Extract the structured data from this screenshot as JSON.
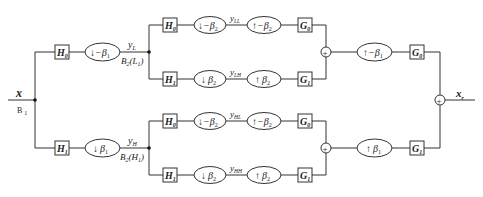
{
  "diagram": {
    "type": "two-level filter bank block diagram",
    "input": {
      "label": "x",
      "sublabel": "B",
      "sublabel_sub": "1"
    },
    "output": {
      "label": "x",
      "label_sub": "r"
    },
    "level1": {
      "low": {
        "analysis_filter": {
          "name": "H",
          "sub": "0"
        },
        "downsampler": {
          "arrow": "↓",
          "factor": "−β",
          "factor_sub": "1"
        },
        "signal": {
          "name": "y",
          "sub": "L"
        },
        "space": {
          "name": "B",
          "sub": "2",
          "arg": "L",
          "arg_sub": "1"
        }
      },
      "high": {
        "analysis_filter": {
          "name": "H",
          "sub": "1"
        },
        "downsampler": {
          "arrow": "↓",
          "factor": "β",
          "factor_sub": "1"
        },
        "signal": {
          "name": "y",
          "sub": "H"
        },
        "space": {
          "name": "B",
          "sub": "2",
          "arg": "H",
          "arg_sub": "1"
        }
      }
    },
    "level2": [
      {
        "h": {
          "name": "H",
          "sub": "0"
        },
        "down": {
          "arrow": "↓",
          "factor": "−β",
          "factor_sub": "2"
        },
        "signal": {
          "name": "y",
          "sub": "LL"
        },
        "up": {
          "arrow": "↑",
          "factor": "−β",
          "factor_sub": "2"
        },
        "g": {
          "name": "G",
          "sub": "0"
        }
      },
      {
        "h": {
          "name": "H",
          "sub": "1"
        },
        "down": {
          "arrow": "↓",
          "factor": "β",
          "factor_sub": "2"
        },
        "signal": {
          "name": "y",
          "sub": "LH"
        },
        "up": {
          "arrow": "↑",
          "factor": "β",
          "factor_sub": "2"
        },
        "g": {
          "name": "G",
          "sub": "1"
        }
      },
      {
        "h": {
          "name": "H",
          "sub": "0"
        },
        "down": {
          "arrow": "↓",
          "factor": "−β",
          "factor_sub": "2"
        },
        "signal": {
          "name": "y",
          "sub": "HL"
        },
        "up": {
          "arrow": "↑",
          "factor": "−β",
          "factor_sub": "2"
        },
        "g": {
          "name": "G",
          "sub": "0"
        }
      },
      {
        "h": {
          "name": "H",
          "sub": "1"
        },
        "down": {
          "arrow": "↓",
          "factor": "β",
          "factor_sub": "2"
        },
        "signal": {
          "name": "y",
          "sub": "HH"
        },
        "up": {
          "arrow": "↑",
          "factor": "β",
          "factor_sub": "2"
        },
        "g": {
          "name": "G",
          "sub": "1"
        }
      }
    ],
    "synthesis_level1": {
      "low": {
        "sum": "+",
        "upsampler": {
          "arrow": "↑",
          "factor": "−β",
          "factor_sub": "1"
        },
        "filter": {
          "name": "G",
          "sub": "0"
        }
      },
      "high": {
        "sum": "+",
        "upsampler": {
          "arrow": "↑",
          "factor": "β",
          "factor_sub": "1"
        },
        "filter": {
          "name": "G",
          "sub": "1"
        }
      }
    },
    "final_sum": "+"
  }
}
